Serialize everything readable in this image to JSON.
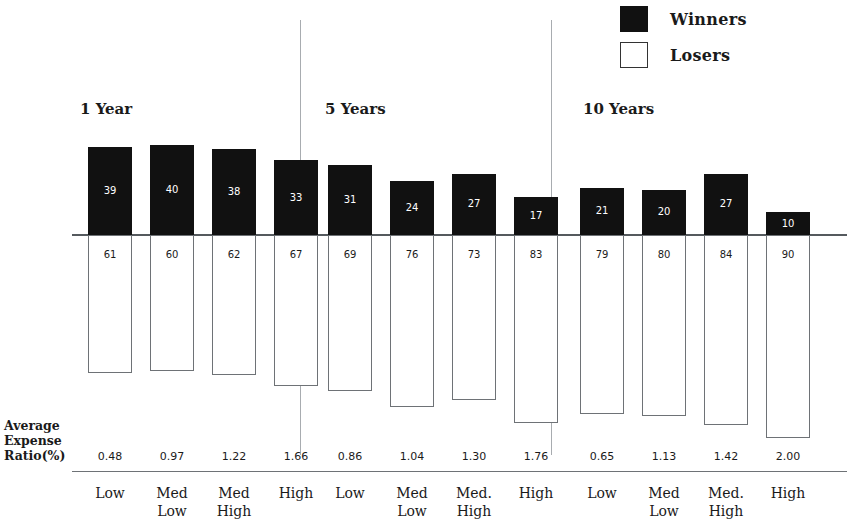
{
  "legend": {
    "entries": [
      {
        "label": "Winners",
        "swatch": "filled",
        "color": "#111111"
      },
      {
        "label": "Losers",
        "swatch": "hollow",
        "color": "#ffffff"
      }
    ]
  },
  "axis": {
    "ratio_caption_line1": "Average",
    "ratio_caption_line2": "Expense",
    "ratio_caption_line3": "Ratio(%)"
  },
  "chart_data": {
    "type": "bar",
    "subtype": "diverging-stacked-percentage",
    "title": "",
    "xlabel": "",
    "ylabel": "",
    "ylim": [
      -100,
      45
    ],
    "grid": false,
    "legend_position": "top-right",
    "groups": [
      {
        "name": "1 Year",
        "categories": [
          "Low",
          "Med\nLow",
          "Med\nHigh",
          "High"
        ],
        "winners": [
          39,
          40,
          38,
          33
        ],
        "losers": [
          61,
          60,
          62,
          67
        ],
        "expense_ratios": [
          "0.48",
          "0.97",
          "1.22",
          "1.66"
        ]
      },
      {
        "name": "5 Years",
        "categories": [
          "Low",
          "Med\nLow",
          "Med.\nHigh",
          "High"
        ],
        "winners": [
          31,
          24,
          27,
          17
        ],
        "losers": [
          69,
          76,
          73,
          83
        ],
        "expense_ratios": [
          "0.86",
          "1.04",
          "1.30",
          "1.76"
        ]
      },
      {
        "name": "10 Years",
        "categories": [
          "Low",
          "Med\nLow",
          "Med.\nHigh",
          "High"
        ],
        "winners": [
          21,
          20,
          27,
          10
        ],
        "losers": [
          79,
          80,
          84,
          90
        ],
        "expense_ratios": [
          "0.65",
          "1.13",
          "1.42",
          "2.00"
        ]
      }
    ],
    "series": [
      {
        "name": "Winners",
        "values": [
          39,
          40,
          38,
          33,
          31,
          24,
          27,
          17,
          21,
          20,
          27,
          10
        ]
      },
      {
        "name": "Losers",
        "values": [
          61,
          60,
          62,
          67,
          69,
          76,
          73,
          83,
          79,
          80,
          84,
          90
        ]
      }
    ]
  }
}
